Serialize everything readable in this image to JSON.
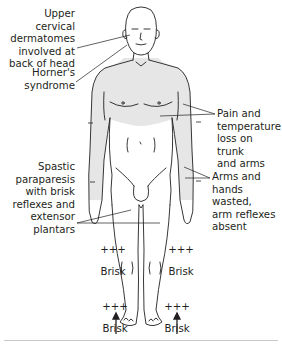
{
  "figure": {
    "shading_color": "#e6e6e6",
    "line_color": "#231f20"
  },
  "labels": {
    "upper_cervical": "Upper cervical\ndermatomes\ninvolved at\nback of head",
    "horners": "Horner's\nsyndrome",
    "pain_temp": "Pain and\ntemperature\nloss on trunk\nand arms",
    "spastic": "Spastic\nparaparesis\nwith brisk\nreflexes and\nextensor\nplantars",
    "arms_wasted": "Arms and\nhands wasted,\narm reflexes\nabsent"
  },
  "reflexes": {
    "knee_left_sign": "+++",
    "knee_left_text": "Brisk",
    "knee_right_sign": "+++",
    "knee_right_text": "Brisk",
    "ankle_left_sign": "+++",
    "ankle_left_text": "Brisk",
    "ankle_right_sign": "+++",
    "ankle_right_text": "Brisk"
  },
  "arm_reflex_marks": [
    "–",
    "–",
    "–",
    "–"
  ],
  "plantar_arrows": [
    "up-arrow",
    "up-arrow"
  ]
}
